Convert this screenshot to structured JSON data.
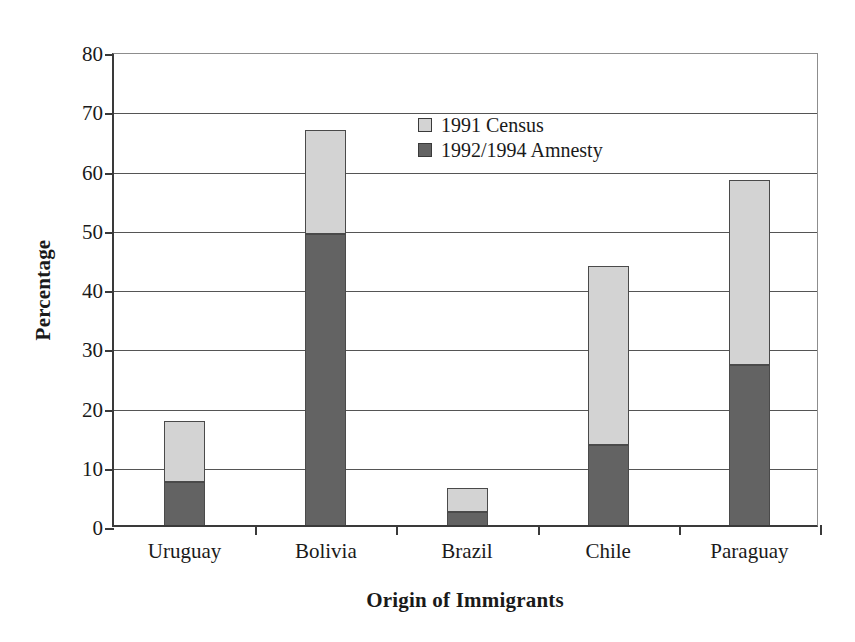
{
  "chart_data": {
    "type": "bar",
    "subtype": "stacked-vertical",
    "title": "",
    "xlabel": "Origin of Immigrants",
    "ylabel": "Percentage",
    "categories": [
      "Uruguay",
      "Bolivia",
      "Brazil",
      "Chile",
      "Paraguay"
    ],
    "series": [
      {
        "name": "1992/1994 Amnesty",
        "color": "#636363",
        "values": [
          7.2,
          49.2,
          2.2,
          13.5,
          27.0
        ]
      },
      {
        "name": "1991 Census",
        "color": "#d3d3d3",
        "values": [
          10.3,
          17.5,
          4.1,
          30.3,
          31.2
        ]
      }
    ],
    "stack_totals": [
      17.5,
      66.7,
      6.3,
      43.8,
      58.2
    ],
    "stack_order_bottom_to_top": [
      "1992/1994 Amnesty",
      "1991 Census"
    ],
    "ylim": [
      0,
      80
    ],
    "ytick_step": 10,
    "yticks": [
      0,
      10,
      20,
      30,
      40,
      50,
      60,
      70,
      80
    ],
    "ytick_labels": [
      "0",
      "10",
      "20",
      "30",
      "40",
      "50",
      "60",
      "70",
      "80"
    ],
    "grid": {
      "horizontal": true,
      "vertical": false
    },
    "legend": {
      "position": "inside-upper-center",
      "entries": [
        {
          "label": "1991 Census",
          "color": "#d3d3d3"
        },
        {
          "label": "1992/1994 Amnesty",
          "color": "#636363"
        }
      ]
    },
    "axis_color": "#3a3a3a",
    "gridline_color": "#555555",
    "background": "#ffffff"
  }
}
